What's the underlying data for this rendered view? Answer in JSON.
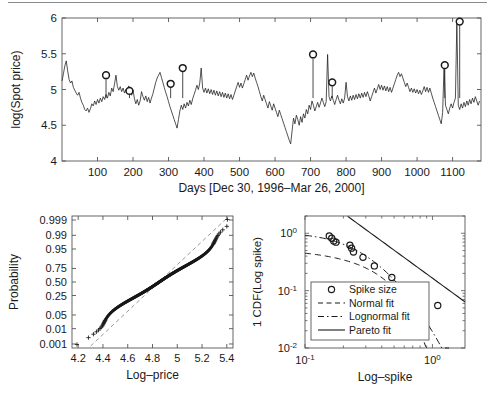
{
  "figure": {
    "background": "#ffffff",
    "ink": "#1a1a1a",
    "axis_color": "#555555",
    "grid": false,
    "top_rule": true
  },
  "chart_data": [
    {
      "id": "spot-price-timeseries",
      "type": "line",
      "title": "",
      "xlabel": "Days [Dec 30, 1996–Mar 26, 2000]",
      "ylabel": "log(Spot price)",
      "xlim": [
        0,
        1180
      ],
      "ylim": [
        4,
        6
      ],
      "xticks": [
        100,
        200,
        300,
        400,
        500,
        600,
        700,
        800,
        900,
        1000,
        1100
      ],
      "xticklabels": [
        "100",
        "200",
        "300",
        "400",
        "500",
        "600",
        "700",
        "800",
        "900",
        "1000",
        "1100"
      ],
      "yticks": [
        4,
        4.5,
        5,
        5.5,
        6
      ],
      "yticklabels": [
        "4",
        "4.5",
        "5",
        "5.5",
        "6"
      ],
      "series": [
        {
          "name": "log(Spot price)",
          "style": "solid",
          "color": "#1a1a1a",
          "x": [
            0,
            4,
            8,
            12,
            16,
            20,
            24,
            28,
            32,
            36,
            40,
            44,
            48,
            52,
            56,
            60,
            64,
            68,
            72,
            76,
            80,
            84,
            88,
            92,
            96,
            100,
            104,
            108,
            112,
            116,
            120,
            124,
            128,
            132,
            136,
            140,
            144,
            148,
            152,
            156,
            160,
            164,
            168,
            172,
            176,
            180,
            184,
            188,
            192,
            196,
            200,
            204,
            208,
            212,
            216,
            220,
            224,
            228,
            232,
            236,
            240,
            244,
            248,
            252,
            256,
            260,
            264,
            268,
            272,
            276,
            280,
            284,
            288,
            292,
            296,
            300,
            304,
            308,
            312,
            316,
            320,
            324,
            328,
            332,
            336,
            340,
            344,
            348,
            352,
            356,
            360,
            364,
            368,
            372,
            376,
            380,
            384,
            388,
            392,
            396,
            400,
            404,
            408,
            412,
            416,
            420,
            424,
            428,
            432,
            436,
            440,
            444,
            448,
            452,
            456,
            460,
            464,
            468,
            472,
            476,
            480,
            484,
            488,
            492,
            496,
            500,
            504,
            508,
            512,
            516,
            520,
            524,
            528,
            532,
            536,
            540,
            544,
            548,
            552,
            556,
            560,
            564,
            568,
            572,
            576,
            580,
            584,
            588,
            592,
            596,
            600,
            604,
            608,
            612,
            616,
            620,
            624,
            628,
            632,
            636,
            640,
            644,
            648,
            652,
            656,
            660,
            664,
            668,
            672,
            676,
            680,
            684,
            688,
            692,
            696,
            700,
            704,
            708,
            712,
            716,
            720,
            724,
            728,
            732,
            736,
            740,
            744,
            748,
            752,
            756,
            760,
            764,
            768,
            772,
            776,
            780,
            784,
            788,
            792,
            796,
            800,
            804,
            808,
            812,
            816,
            820,
            824,
            828,
            832,
            836,
            840,
            844,
            848,
            852,
            856,
            860,
            864,
            868,
            872,
            876,
            880,
            884,
            888,
            892,
            896,
            900,
            904,
            908,
            912,
            916,
            920,
            924,
            928,
            932,
            936,
            940,
            944,
            948,
            952,
            956,
            960,
            964,
            968,
            972,
            976,
            980,
            984,
            988,
            992,
            996,
            1000,
            1004,
            1008,
            1012,
            1016,
            1020,
            1024,
            1028,
            1032,
            1036,
            1040,
            1044,
            1048,
            1052,
            1056,
            1060,
            1064,
            1068,
            1072,
            1076,
            1080,
            1084,
            1088,
            1092,
            1096,
            1100,
            1104,
            1108,
            1112,
            1116,
            1120,
            1124,
            1128,
            1132,
            1136,
            1140,
            1144,
            1148,
            1152,
            1156,
            1160,
            1164,
            1168,
            1172,
            1176
          ],
          "y": [
            5.12,
            5.22,
            5.33,
            5.4,
            5.26,
            5.14,
            5.09,
            5.12,
            5.03,
            4.99,
            4.95,
            4.92,
            4.96,
            4.88,
            4.82,
            4.78,
            4.72,
            4.7,
            4.74,
            4.68,
            4.73,
            4.8,
            4.77,
            4.84,
            4.79,
            4.86,
            4.81,
            4.88,
            4.83,
            4.9,
            4.86,
            4.93,
            4.88,
            4.96,
            4.91,
            5.02,
            4.97,
            5.08,
            5.2,
            5.04,
            4.99,
            5.04,
            4.97,
            5.02,
            4.95,
            5.0,
            4.94,
            5.05,
            4.98,
            4.92,
            4.99,
            4.87,
            4.8,
            4.86,
            4.78,
            4.84,
            4.97,
            4.9,
            4.85,
            4.91,
            4.83,
            4.89,
            4.81,
            4.88,
            4.94,
            5.02,
            5.1,
            5.16,
            5.2,
            5.24,
            5.17,
            5.1,
            5.03,
            4.96,
            4.9,
            4.83,
            4.76,
            4.7,
            4.64,
            4.58,
            4.52,
            4.46,
            4.58,
            4.7,
            4.78,
            4.72,
            4.8,
            4.74,
            4.82,
            4.77,
            4.85,
            4.79,
            4.87,
            4.93,
            4.99,
            5.06,
            5.0,
            5.09,
            5.3,
            5.02,
            4.96,
            5.02,
            4.95,
            5.01,
            4.94,
            5.0,
            4.93,
            4.99,
            4.92,
            4.98,
            4.91,
            4.97,
            4.9,
            4.96,
            4.89,
            4.95,
            4.88,
            4.94,
            4.87,
            4.93,
            4.86,
            4.92,
            4.98,
            5.04,
            5.1,
            5.03,
            5.09,
            5.02,
            5.08,
            5.14,
            5.2,
            5.13,
            5.19,
            5.24,
            5.18,
            5.23,
            5.16,
            5.1,
            5.04,
            4.97,
            4.9,
            4.84,
            4.92,
            4.86,
            4.8,
            4.74,
            4.83,
            4.77,
            4.71,
            4.8,
            4.74,
            4.68,
            4.62,
            4.71,
            4.65,
            4.59,
            4.53,
            4.47,
            4.41,
            4.35,
            4.29,
            4.24,
            4.42,
            4.6,
            4.52,
            4.64,
            4.58,
            4.5,
            4.62,
            4.54,
            4.66,
            4.6,
            4.72,
            4.66,
            4.78,
            4.72,
            4.84,
            4.78,
            4.7,
            4.76,
            4.82,
            4.75,
            4.81,
            4.88,
            4.82,
            4.76,
            4.83,
            5.49,
            4.9,
            4.84,
            4.91,
            4.85,
            4.79,
            4.86,
            4.92,
            4.85,
            4.8,
            4.87,
            4.81,
            4.88,
            5.1,
            4.9,
            4.84,
            4.91,
            4.85,
            4.92,
            4.86,
            4.93,
            4.87,
            4.94,
            4.88,
            4.95,
            4.89,
            4.96,
            4.9,
            4.97,
            4.91,
            4.84,
            4.9,
            4.96,
            5.02,
            4.95,
            5.01,
            5.07,
            5.0,
            5.06,
            4.99,
            5.05,
            4.98,
            5.04,
            4.97,
            5.03,
            4.96,
            5.02,
            5.08,
            5.14,
            5.2,
            5.24,
            5.18,
            5.22,
            5.16,
            5.1,
            5.04,
            5.09,
            5.03,
            4.97,
            5.02,
            4.96,
            5.01,
            4.95,
            5.0,
            4.94,
            4.99,
            4.93,
            4.98,
            5.04,
            4.97,
            5.03,
            4.96,
            5.02,
            4.95,
            4.88,
            4.82,
            4.76,
            4.7,
            4.64,
            4.58,
            4.52,
            4.68,
            5.34,
            4.78,
            4.72,
            4.66,
            4.74,
            4.8,
            4.74,
            4.82,
            4.88,
            5.95,
            4.78,
            4.72,
            4.8,
            4.74,
            4.82,
            4.76,
            4.84,
            4.78,
            4.86,
            4.8,
            4.88,
            4.82,
            4.9,
            4.84,
            4.78,
            4.84
          ]
        }
      ],
      "markers": {
        "name": "Spike size",
        "symbol": "circle",
        "points": [
          {
            "x": 124,
            "y": 5.2
          },
          {
            "x": 190,
            "y": 4.98
          },
          {
            "x": 306,
            "y": 5.08
          },
          {
            "x": 340,
            "y": 5.3
          },
          {
            "x": 707,
            "y": 5.49
          },
          {
            "x": 761,
            "y": 5.1
          },
          {
            "x": 1078,
            "y": 5.34
          },
          {
            "x": 1120,
            "y": 5.95
          }
        ]
      }
    },
    {
      "id": "normal-probability-plot",
      "type": "scatter",
      "title": "",
      "xlabel": "Log–price",
      "ylabel": "Probability",
      "xlim": [
        4.15,
        5.45
      ],
      "ylim_probability": [
        0.0005,
        0.9995
      ],
      "xticks": [
        4.2,
        4.4,
        4.6,
        4.8,
        5.0,
        5.2,
        5.4
      ],
      "xticklabels": [
        "4.2",
        "4.4",
        "4.6",
        "4.8",
        "5",
        "5.2",
        "5.4"
      ],
      "yticks": [
        0.001,
        0.01,
        0.05,
        0.25,
        0.5,
        0.75,
        0.95,
        0.99,
        0.999
      ],
      "yticklabels": [
        "0.001",
        "0.01",
        "0.05",
        "0.25",
        "0.50",
        "0.75",
        "0.95",
        "0.99",
        "0.999"
      ],
      "marker": "plus",
      "reference_line": {
        "style": "dashed",
        "color": "#8a8a8a"
      },
      "points_summary": "Dense + markers tracing a slightly S-shaped path from (4.21, 0.0008) up to (5.40, 0.9993)"
    },
    {
      "id": "spike-size-tail-plot",
      "type": "line",
      "title": "",
      "xlabel": "Log–spike",
      "ylabel": "1 CDF(Log  spike)",
      "xscale": "log",
      "yscale": "log",
      "xlim": [
        0.1,
        1.8
      ],
      "ylim": [
        0.01,
        2.0
      ],
      "xticks": [
        0.1,
        1.0
      ],
      "xticklabels": [
        "10^-1",
        "10^0"
      ],
      "yticks": [
        0.01,
        0.1,
        1.0
      ],
      "yticklabels": [
        "10^-2",
        "10^-1",
        "10^0"
      ],
      "data_points": {
        "name": "Spike size",
        "x": [
          0.155,
          0.162,
          0.168,
          0.175,
          0.225,
          0.232,
          0.24,
          0.285,
          0.35,
          0.48,
          1.1
        ],
        "y": [
          0.9,
          0.82,
          0.73,
          0.7,
          0.62,
          0.55,
          0.47,
          0.38,
          0.27,
          0.17,
          0.055
        ]
      },
      "fits": [
        {
          "name": "Normal fit",
          "style": "dashed"
        },
        {
          "name": "Lognormal fit",
          "style": "dashdot"
        },
        {
          "name": "Pareto fit",
          "style": "solid"
        }
      ],
      "legend": {
        "position": "lower-left",
        "entries": [
          {
            "label": "Spike size",
            "marker": "circle",
            "style": "none"
          },
          {
            "label": "Normal fit",
            "marker": "none",
            "style": "dashed"
          },
          {
            "label": "Lognormal fit",
            "marker": "none",
            "style": "dashdot"
          },
          {
            "label": "Pareto fit",
            "marker": "none",
            "style": "solid"
          }
        ]
      }
    }
  ],
  "labels": {
    "top": {
      "ylabel": "log(Spot price)",
      "xlabel": "Days [Dec 30, 1996–Mar 26, 2000]",
      "yticks": [
        "4",
        "4.5",
        "5",
        "5.5",
        "6"
      ],
      "xticks": [
        "100",
        "200",
        "300",
        "400",
        "500",
        "600",
        "700",
        "800",
        "900",
        "1000",
        "1100"
      ]
    },
    "bottom_left": {
      "ylabel": "Probability",
      "xlabel": "Log–price",
      "yticks": [
        "0.999",
        "0.99",
        "0.95",
        "0.75",
        "0.50",
        "0.25",
        "0.05",
        "0.01",
        "0.001"
      ],
      "xticks": [
        "4.2",
        "4.4",
        "4.6",
        "4.8",
        "5",
        "5.2",
        "5.4"
      ]
    },
    "bottom_right": {
      "ylabel": "1 CDF(Log  spike)",
      "xlabel": "Log–spike",
      "yticks": [
        "10",
        "10",
        "10"
      ],
      "ysupers": [
        "0",
        "-1",
        "-2"
      ],
      "xticks": [
        "10",
        "10"
      ],
      "xsupers": [
        "-1",
        "0"
      ],
      "legend": [
        "Spike size",
        "Normal fit",
        "Lognormal fit",
        "Pareto fit"
      ]
    }
  }
}
